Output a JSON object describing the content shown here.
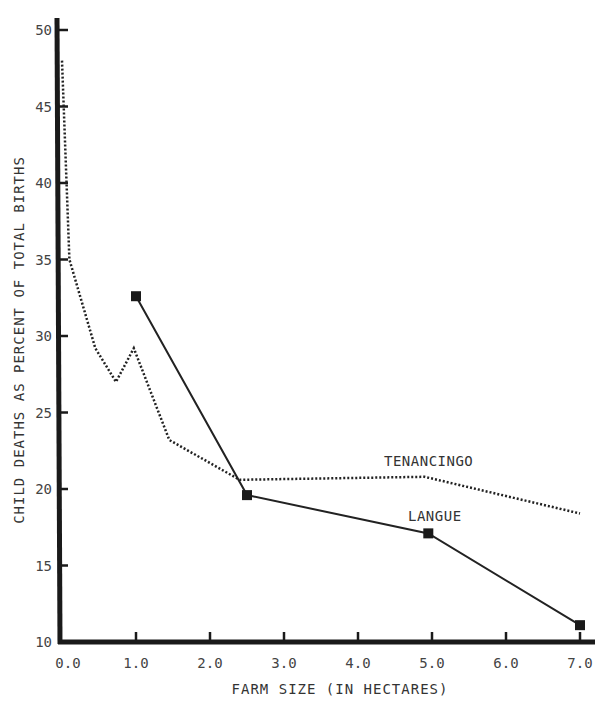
{
  "chart_data": {
    "type": "line",
    "title": "",
    "xlabel": "FARM SIZE (IN HECTARES)",
    "ylabel": "CHILD DEATHS AS PERCENT OF TOTAL BIRTHS",
    "xlim": [
      0,
      7
    ],
    "ylim": [
      10,
      50
    ],
    "x_ticks": [
      "0.0",
      "1.0",
      "2.0",
      "3.0",
      "4.0",
      "5.0",
      "6.0",
      "7.0"
    ],
    "y_ticks": [
      "10",
      "15",
      "20",
      "25",
      "30",
      "35",
      "40",
      "45",
      "50"
    ],
    "grid": false,
    "legend": "inline labels",
    "series": [
      {
        "name": "TENANCINGO",
        "style": "dotted",
        "markers": false,
        "x": [
          0.0,
          0.1,
          0.45,
          0.73,
          0.97,
          1.45,
          2.4,
          4.9,
          7.0
        ],
        "y": [
          48.0,
          35.0,
          29.2,
          27.0,
          29.2,
          23.2,
          20.6,
          20.8,
          18.4
        ]
      },
      {
        "name": "LANGUE",
        "style": "solid",
        "markers": true,
        "x": [
          1.0,
          2.5,
          4.95,
          7.0
        ],
        "y": [
          32.6,
          19.6,
          17.1,
          11.1
        ]
      }
    ],
    "annotations": [
      {
        "text": "TENANCINGO",
        "x": 4.5,
        "y": 21.9
      },
      {
        "text": "LANGUE",
        "x": 4.7,
        "y": 18.3
      }
    ]
  },
  "labels": {
    "xlabel": "FARM SIZE (IN HECTARES)",
    "ylabel": "CHILD DEATHS AS PERCENT OF TOTAL BIRTHS",
    "tenancingo": "TENANCINGO",
    "langue": "LANGUE"
  }
}
